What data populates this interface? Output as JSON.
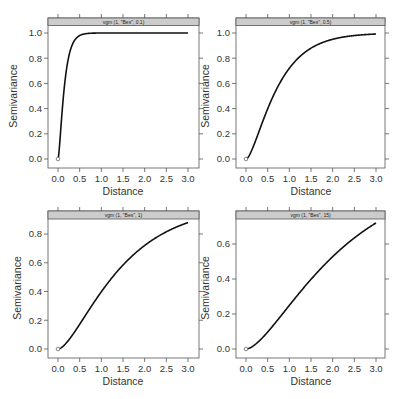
{
  "chart_data": [
    {
      "type": "line",
      "title": "vgm (1, \"Bes\", 0.1)",
      "model": {
        "psill": 1,
        "model": "Bes",
        "range": 0.1
      },
      "xlabel": "Distance",
      "ylabel": "Semivariance",
      "xlim": [
        0,
        3
      ],
      "ylim": [
        0,
        1.0
      ],
      "x_ticks": [
        "0.0",
        "0.5",
        "1.0",
        "1.5",
        "2.0",
        "2.5",
        "3.0"
      ],
      "y_ticks": [
        "0.0",
        "0.2",
        "0.4",
        "0.6",
        "0.8",
        "1.0"
      ],
      "series": [
        {
          "name": "variogram",
          "x": [
            0,
            0.1,
            0.2,
            0.3,
            0.5,
            0.75,
            1.0,
            1.5,
            2.0,
            3.0
          ],
          "values": [
            0,
            0.4,
            0.76,
            0.9,
            0.98,
            1.0,
            1.0,
            1.0,
            1.0,
            1.0
          ]
        }
      ],
      "grid": false
    },
    {
      "type": "line",
      "title": "vgm (1, \"Bes\", 0.5)",
      "model": {
        "psill": 1,
        "model": "Bes",
        "range": 0.5
      },
      "xlabel": "Distance",
      "ylabel": "Semivariance",
      "xlim": [
        0,
        3
      ],
      "ylim": [
        0,
        1.0
      ],
      "x_ticks": [
        "0.0",
        "0.5",
        "1.0",
        "1.5",
        "2.0",
        "2.5",
        "3.0"
      ],
      "y_ticks": [
        "0.0",
        "0.2",
        "0.4",
        "0.6",
        "0.8",
        "1.0"
      ],
      "series": [
        {
          "name": "variogram",
          "x": [
            0,
            0.25,
            0.5,
            0.75,
            1.0,
            1.5,
            2.0,
            2.5,
            3.0
          ],
          "values": [
            0,
            0.17,
            0.4,
            0.59,
            0.73,
            0.88,
            0.95,
            0.98,
            0.99
          ]
        }
      ],
      "grid": false
    },
    {
      "type": "line",
      "title": "vgm (1, \"Bes\", 1)",
      "model": {
        "psill": 1,
        "model": "Bes",
        "range": 1
      },
      "xlabel": "Distance",
      "ylabel": "Semivariance",
      "xlim": [
        0,
        3
      ],
      "ylim": [
        0,
        0.88
      ],
      "x_ticks": [
        "0.0",
        "0.5",
        "1.0",
        "1.5",
        "2.0",
        "2.5",
        "3.0"
      ],
      "y_ticks": [
        "0.0",
        "0.2",
        "0.4",
        "0.6",
        "0.8"
      ],
      "series": [
        {
          "name": "variogram",
          "x": [
            0,
            0.5,
            1.0,
            1.5,
            2.0,
            2.5,
            3.0
          ],
          "values": [
            0,
            0.17,
            0.4,
            0.58,
            0.72,
            0.81,
            0.88
          ]
        }
      ],
      "grid": false
    },
    {
      "type": "line",
      "title": "vgm (1, \"Bes\", 15)",
      "model": {
        "psill": 1,
        "model": "Bes",
        "range": 1.5
      },
      "xlabel": "Distance",
      "ylabel": "Semivariance",
      "xlim": [
        0,
        3
      ],
      "ylim": [
        0,
        0.72
      ],
      "x_ticks": [
        "0.0",
        "0.5",
        "1.0",
        "1.5",
        "2.0",
        "2.5",
        "3.0"
      ],
      "y_ticks": [
        "0.0",
        "0.2",
        "0.4",
        "0.6"
      ],
      "series": [
        {
          "name": "variogram",
          "x": [
            0,
            0.5,
            1.0,
            1.5,
            2.0,
            2.5,
            3.0
          ],
          "values": [
            0,
            0.09,
            0.25,
            0.4,
            0.53,
            0.63,
            0.72
          ]
        }
      ],
      "grid": false
    }
  ],
  "panels": [
    {
      "strip": "vgm (1, \"Bes\", 0.1)",
      "range": 0.1
    },
    {
      "strip": "vgm (1, \"Bes\", 0.5)",
      "range": 0.5
    },
    {
      "strip": "vgm (1, \"Bes\", 1)",
      "range": 1
    },
    {
      "strip": "vgm (1, \"Bes\", 15)",
      "range": 1.5
    }
  ],
  "labels": {
    "xlabel": "Distance",
    "ylabel": "Semivariance"
  },
  "colors": {
    "strip_fill": "#cccccc",
    "frame": "#555555",
    "curve": "#111111",
    "text": "#333333"
  }
}
